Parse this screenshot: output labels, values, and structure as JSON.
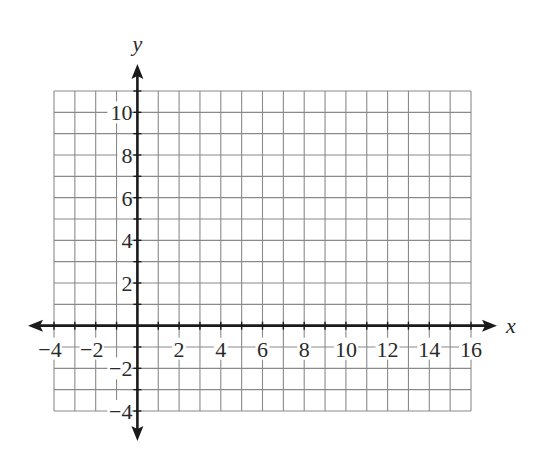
{
  "chart_data": {
    "type": "scatter",
    "title": "",
    "xlabel": "x",
    "ylabel": "y",
    "xlim": [
      -4,
      16
    ],
    "ylim": [
      -4,
      11
    ],
    "grid": true,
    "grid_step": 1,
    "x_ticks": [
      -4,
      -2,
      2,
      4,
      6,
      8,
      10,
      12,
      14,
      16
    ],
    "x_tick_labels": [
      "−4",
      "−2",
      "2",
      "4",
      "6",
      "8",
      "10",
      "12",
      "14",
      "16"
    ],
    "y_ticks": [
      -4,
      -2,
      2,
      4,
      6,
      8,
      10
    ],
    "y_tick_labels": [
      "−4",
      "−2",
      "2",
      "4",
      "6",
      "8",
      "10"
    ],
    "series": [],
    "legend": null,
    "axes_arrows": true
  },
  "colors": {
    "grid": "#8a8a8a",
    "axis": "#1a1a1a",
    "text": "#2a2a2a",
    "background": "#ffffff"
  },
  "layout": {
    "grid_left": 54,
    "grid_top": 91,
    "grid_right": 471,
    "grid_bottom": 411
  }
}
